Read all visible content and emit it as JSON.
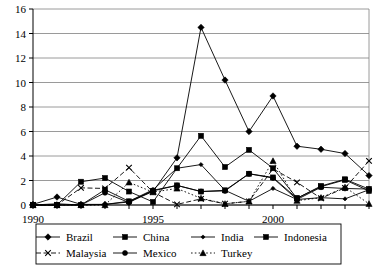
{
  "chart_data": {
    "type": "line",
    "title": "",
    "subtitle": "",
    "xlabel": "",
    "ylabel": "",
    "xlim": [
      1990,
      2004
    ],
    "ylim": [
      0,
      16
    ],
    "ytick_step": 2,
    "yticks": [
      "0",
      "2",
      "4",
      "6",
      "8",
      "10",
      "12",
      "14",
      "16"
    ],
    "xticks_all": [
      1990,
      1991,
      1992,
      1993,
      1994,
      1995,
      1996,
      1997,
      1998,
      1999,
      2000,
      2001,
      2002,
      2003,
      2004
    ],
    "xtick_labels": [
      "1990",
      "",
      "",
      "",
      "",
      "1995",
      "",
      "",
      "",
      "",
      "2000",
      "",
      "",
      "",
      ""
    ],
    "x": [
      1990,
      1991,
      1992,
      1993,
      1994,
      1995,
      1996,
      1997,
      1998,
      1999,
      2000,
      2001,
      2002,
      2003,
      2004
    ],
    "grid": true,
    "grid_axis": "y",
    "legend_position": "bottom",
    "series": [
      {
        "name": "Brazil",
        "marker": "diamond",
        "linestyle": "solid",
        "values": [
          0.05,
          0.65,
          0.05,
          0.05,
          0.25,
          1.1,
          3.85,
          14.5,
          10.2,
          6.0,
          8.9,
          4.8,
          4.55,
          4.2,
          2.4
        ]
      },
      {
        "name": "China",
        "marker": "square",
        "linestyle": "solid",
        "values": [
          0.0,
          0.0,
          1.9,
          2.2,
          1.1,
          0.25,
          3.0,
          5.65,
          3.1,
          4.5,
          3.0,
          0.55,
          1.55,
          2.1,
          1.3
        ]
      },
      {
        "name": "India",
        "marker": "diamond-small",
        "linestyle": "solid",
        "values": [
          0.0,
          0.1,
          0.0,
          0.05,
          0.3,
          1.25,
          3.0,
          3.3,
          1.2,
          0.3,
          1.35,
          0.45,
          0.6,
          0.5,
          1.25
        ]
      },
      {
        "name": "Indonesia",
        "marker": "square",
        "linestyle": "solid",
        "values": [
          0.0,
          0.0,
          0.0,
          1.25,
          0.3,
          1.15,
          1.6,
          1.1,
          1.2,
          2.55,
          2.25,
          0.55,
          1.5,
          2.05,
          1.15
        ]
      },
      {
        "name": "Malaysia",
        "marker": "x",
        "linestyle": "dashed",
        "values": [
          0.0,
          0.0,
          1.4,
          1.35,
          3.05,
          1.05,
          0.05,
          0.5,
          0.1,
          0.3,
          2.95,
          1.85,
          0.55,
          1.4,
          3.6
        ]
      },
      {
        "name": "Mexico",
        "marker": "circle",
        "linestyle": "solid",
        "values": [
          0.0,
          0.0,
          0.0,
          1.0,
          0.2,
          1.2,
          1.6,
          1.1,
          1.15,
          2.55,
          2.2,
          0.45,
          1.45,
          1.35,
          1.3
        ]
      },
      {
        "name": "Turkey",
        "marker": "triangle",
        "linestyle": "dotted",
        "values": [
          0.0,
          0.0,
          0.0,
          0.0,
          1.85,
          1.05,
          1.35,
          0.55,
          0.1,
          0.3,
          3.6,
          0.35,
          0.6,
          1.45,
          0.1
        ]
      }
    ]
  },
  "colors": {
    "ink": "#000000",
    "grid": "#808080",
    "background": "#ffffff"
  }
}
